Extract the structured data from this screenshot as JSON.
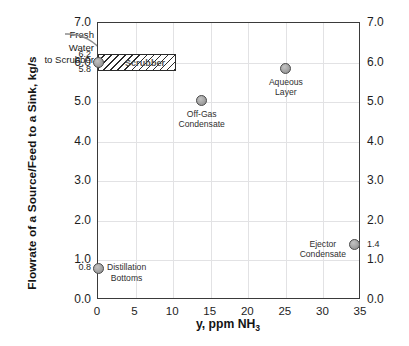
{
  "chart_data": {
    "type": "scatter",
    "title": "",
    "xlabel": "y, ppm NH3",
    "xlabel_parts": {
      "main": "y, ppm NH",
      "sub": "3"
    },
    "ylabel": "Flowrate of a Source/Feed to a Sink, kg/s",
    "xlim": [
      0,
      35
    ],
    "ylim": [
      0,
      7
    ],
    "xticks": [
      "0",
      "5",
      "10",
      "15",
      "20",
      "25",
      "30",
      "35"
    ],
    "xtick_values": [
      0,
      5,
      10,
      15,
      20,
      25,
      30,
      35
    ],
    "yticks": [
      "0.0",
      "1.0",
      "2.0",
      "3.0",
      "4.0",
      "5.0",
      "6.0",
      "7.0"
    ],
    "ytick_values": [
      0,
      1,
      2,
      3,
      4,
      5,
      6,
      7
    ],
    "yticks_right": [
      "0.0",
      "1.0",
      "2.0",
      "3.0",
      "4.0",
      "5.0",
      "6.0",
      "7.0"
    ],
    "yminor_left": [
      {
        "label": "6.2",
        "value": 6.2
      },
      {
        "label": "5.8",
        "value": 5.8
      },
      {
        "label": "0.8",
        "value": 0.8
      }
    ],
    "yminor_right": [
      {
        "label": "1.4",
        "value": 1.4
      }
    ],
    "grid": true,
    "legend": "none",
    "points": [
      {
        "name": "Fresh Water to Scrubber",
        "label": "",
        "x": 0,
        "y": 6.0,
        "label_pos": "none"
      },
      {
        "name": "Distillation Bottoms",
        "label": "Distillation\nBottoms",
        "x": 0,
        "y": 0.8,
        "label_pos": "right"
      },
      {
        "name": "Off-Gas Condensate",
        "label": "Off-Gas\nCondensate",
        "x": 13.8,
        "y": 5.03,
        "label_pos": "below"
      },
      {
        "name": "Aqueous Layer",
        "label": "Aqueous\nLayer",
        "x": 25,
        "y": 5.85,
        "label_pos": "below"
      },
      {
        "name": "Ejector Condensate",
        "label": "Ejector\nCondensate",
        "x": 34.2,
        "y": 1.4,
        "label_pos": "left"
      }
    ],
    "boxes": [
      {
        "name": "Scrubber",
        "label": "Scrubber",
        "x0": 0,
        "x1": 10.4,
        "y0": 5.78,
        "y1": 6.22,
        "hatch": "diagonal"
      }
    ],
    "annotations": [
      {
        "name": "fresh-water-to-scrubber",
        "text": "Fresh\nWater\nto Scrubber",
        "lines": [
          "Fresh",
          "Water",
          "to Scrubber"
        ],
        "points_to": {
          "x": 0,
          "y": 6.0
        }
      }
    ],
    "colors": {
      "marker_fill": "#9b9b9b",
      "marker_edge": "#4e4e4e",
      "grid": "#e2e2e4",
      "frame": "#3a3a3a",
      "text": "#1d1d1d",
      "hatch": "#2b2b2b",
      "background": "#ffffff"
    }
  }
}
